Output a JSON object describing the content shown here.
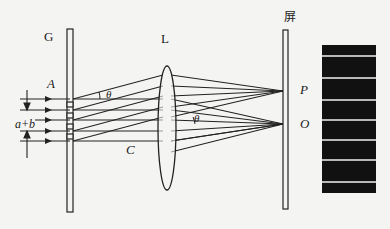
{
  "diagram": {
    "labels": {
      "grating": "G",
      "lens": "L",
      "screen": "屏",
      "point_a": "A",
      "point_c": "C",
      "point_p": "P",
      "point_o": "O",
      "angle_1": "θ",
      "angle_2": "θ",
      "grating_constant": "a+b"
    },
    "colors": {
      "line": "#222222",
      "background": "#f4f4f2",
      "fringe_dark": "#111111",
      "fringe_bright": "#b8b8b8"
    },
    "fringes": {
      "count_bright_lines": 7
    }
  }
}
